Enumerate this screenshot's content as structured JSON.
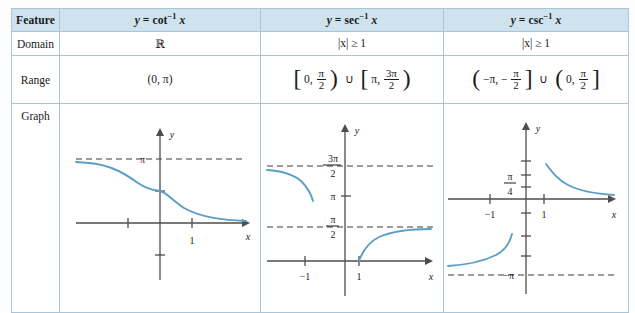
{
  "table": {
    "header": {
      "feature": "Feature",
      "columns": [
        {
          "id": "cot",
          "lhs": "y",
          "eq": "=",
          "fn": "cot",
          "inv": "−1",
          "arg": "x"
        },
        {
          "id": "sec",
          "lhs": "y",
          "eq": "=",
          "fn": "sec",
          "inv": "−1",
          "arg": "x"
        },
        {
          "id": "csc",
          "lhs": "y",
          "eq": "=",
          "fn": "csc",
          "inv": "−1",
          "arg": "x"
        }
      ]
    },
    "rows": [
      {
        "label": "Domain",
        "values": [
          "ℝ",
          "|x| ≥ 1",
          "|x| ≥ 1"
        ]
      },
      {
        "label": "Range",
        "values": [
          "(0, π)",
          "[0, π/2) ∪ [π, 3π/2)",
          "(−π, −π/2] ∪ (0, π/2]"
        ]
      },
      {
        "label": "Graph",
        "values": [
          "",
          ""
        ]
      }
    ]
  },
  "range_parts": {
    "cot": {
      "text": "(0, π)"
    },
    "sec": {
      "open1": "[",
      "a1": "0,",
      "close1": ")",
      "cup": "∪",
      "open2": "[",
      "a2": "π,",
      "close2": ")",
      "f1num": "π",
      "f1den": "2",
      "f2num": "3π",
      "f2den": "2"
    },
    "csc": {
      "open1": "(",
      "a1": "−π, −",
      "close1": "]",
      "cup": "∪",
      "open2": "(",
      "a2": "0,",
      "close2": "]",
      "f1num": "π",
      "f1den": "2",
      "f2num": "π",
      "f2den": "2"
    }
  },
  "domain_values": {
    "cot": "ℝ",
    "sec_abs": "|x| ≥ 1",
    "csc_abs": "|x| ≥ 1"
  },
  "graphs": {
    "cot": {
      "name": "graph-cot-inverse",
      "axis_x_label": "x",
      "axis_y_label": "y",
      "asymptotes": [
        {
          "label": "π",
          "value": 3.14159
        }
      ],
      "x_ticks": [
        {
          "value": -1,
          "label": ""
        },
        {
          "value": 1,
          "label": "1"
        }
      ],
      "y_ticks": [
        {
          "value": 1.5708,
          "label": ""
        },
        {
          "value": -0.7854,
          "label": ""
        }
      ],
      "description": "decreasing curve from y=π to y=0"
    },
    "sec": {
      "name": "graph-sec-inverse",
      "axis_x_label": "x",
      "axis_y_label": "y",
      "asymptotes": [
        {
          "label": "3π/2",
          "num": "3π",
          "den": "2",
          "value": 4.712
        },
        {
          "label": "π/2",
          "num": "π",
          "den": "2",
          "value": 1.5708
        }
      ],
      "y_ticks": [
        {
          "value": 3.14159,
          "label": "π"
        }
      ],
      "x_ticks": [
        {
          "value": -1,
          "label": "−1"
        },
        {
          "value": 1,
          "label": "1"
        }
      ],
      "description": "two branches: left branch below 3π/2, right branch below π/2"
    },
    "csc": {
      "name": "graph-csc-inverse",
      "axis_x_label": "x",
      "axis_y_label": "y",
      "asymptotes": [
        {
          "label": "−π",
          "value": -3.14159
        }
      ],
      "y_ticks": [
        {
          "value": 0.7854,
          "num": "π",
          "den": "4",
          "label": "π/4"
        }
      ],
      "x_ticks": [
        {
          "value": -1,
          "label": "−1"
        },
        {
          "value": 1,
          "label": "1"
        }
      ],
      "description": "two branches: upper-right decreasing to 0, lower-left rising from −π"
    }
  },
  "colors": {
    "header_bg": "#cfe3ee",
    "border": "#a8c6d8",
    "curve": "#5b9ec4",
    "axis": "#4d4d4d",
    "text": "#1a1a1a"
  }
}
